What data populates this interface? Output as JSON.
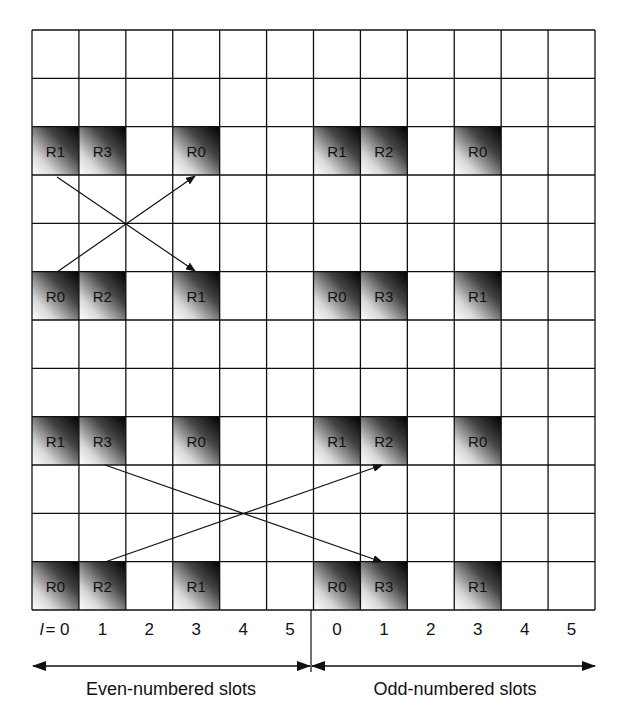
{
  "diagram": {
    "grid": {
      "rows": 12,
      "cols": 12,
      "left": 32,
      "top": 30,
      "width": 563,
      "height": 580,
      "line_color": "#111111"
    },
    "shaded_cells": [
      {
        "row": 2,
        "col": 0,
        "label": "R1"
      },
      {
        "row": 2,
        "col": 1,
        "label": "R3"
      },
      {
        "row": 2,
        "col": 3,
        "label": "R0"
      },
      {
        "row": 2,
        "col": 6,
        "label": "R1"
      },
      {
        "row": 2,
        "col": 7,
        "label": "R2"
      },
      {
        "row": 2,
        "col": 9,
        "label": "R0"
      },
      {
        "row": 5,
        "col": 0,
        "label": "R0"
      },
      {
        "row": 5,
        "col": 1,
        "label": "R2"
      },
      {
        "row": 5,
        "col": 3,
        "label": "R1"
      },
      {
        "row": 5,
        "col": 6,
        "label": "R0"
      },
      {
        "row": 5,
        "col": 7,
        "label": "R3"
      },
      {
        "row": 5,
        "col": 9,
        "label": "R1"
      },
      {
        "row": 8,
        "col": 0,
        "label": "R1"
      },
      {
        "row": 8,
        "col": 1,
        "label": "R3"
      },
      {
        "row": 8,
        "col": 3,
        "label": "R0"
      },
      {
        "row": 8,
        "col": 6,
        "label": "R1"
      },
      {
        "row": 8,
        "col": 7,
        "label": "R2"
      },
      {
        "row": 8,
        "col": 9,
        "label": "R0"
      },
      {
        "row": 11,
        "col": 0,
        "label": "R0"
      },
      {
        "row": 11,
        "col": 1,
        "label": "R2"
      },
      {
        "row": 11,
        "col": 3,
        "label": "R1"
      },
      {
        "row": 11,
        "col": 6,
        "label": "R0"
      },
      {
        "row": 11,
        "col": 7,
        "label": "R3"
      },
      {
        "row": 11,
        "col": 9,
        "label": "R1"
      }
    ],
    "arrows": [
      {
        "x1": 57,
        "y1": 177,
        "x2": 195,
        "y2": 271
      },
      {
        "x1": 57,
        "y1": 272,
        "x2": 195,
        "y2": 176
      },
      {
        "x1": 105,
        "y1": 465,
        "x2": 382,
        "y2": 562
      },
      {
        "x1": 105,
        "y1": 562,
        "x2": 382,
        "y2": 465
      }
    ],
    "axis": {
      "prefix": "l",
      "equals": "= 0",
      "even_ticks": [
        "0",
        "1",
        "2",
        "3",
        "4",
        "5"
      ],
      "odd_ticks": [
        "0",
        "1",
        "2",
        "3",
        "4",
        "5"
      ]
    },
    "spans": {
      "even_label": "Even-numbered slots",
      "odd_label": "Odd-numbered slots"
    },
    "colors": {
      "shade_dark": "#000000",
      "shade_light": "#ffffff",
      "ink": "#111111"
    }
  }
}
